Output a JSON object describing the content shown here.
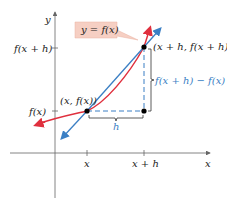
{
  "diagram": {
    "colors": {
      "curve": "#e0303e",
      "secant": "#3b7fc4",
      "axis": "#666666",
      "label_box_fill": "#f6cfc3",
      "dashed": "#3b7fc4",
      "bracket": "#333333"
    },
    "axes": {
      "x_label": "x",
      "y_label": "y",
      "x_ticks": [
        "x",
        "x + h"
      ],
      "y_ticks": [
        "f(x + h)",
        "f(x)"
      ]
    },
    "function_label": "y = f(x)",
    "points": {
      "p1": "(x, f(x))",
      "p2": "(x + h, f(x + h))"
    },
    "annotations": {
      "horizontal_difference": "h",
      "vertical_difference": "f(x + h) − f(x)"
    }
  }
}
